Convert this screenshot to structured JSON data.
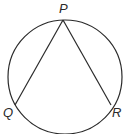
{
  "diagram": {
    "type": "inscribed-angle",
    "circle": {
      "cx": 65,
      "cy": 77,
      "r": 57
    },
    "points": [
      {
        "name": "P",
        "x": 63,
        "y": 20,
        "label_x": 59,
        "label_y": 13
      },
      {
        "name": "Q",
        "x": 15,
        "y": 105,
        "label_x": 3,
        "label_y": 117
      },
      {
        "name": "R",
        "x": 111,
        "y": 105,
        "label_x": 112,
        "label_y": 117
      }
    ],
    "segments": [
      {
        "from": "P",
        "to": "Q"
      },
      {
        "from": "P",
        "to": "R"
      }
    ],
    "stroke_color": "#2a2a2a"
  }
}
